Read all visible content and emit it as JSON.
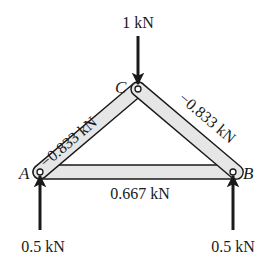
{
  "diagram": {
    "type": "truss",
    "nodes": [
      {
        "id": "A",
        "label": "A",
        "x": 40,
        "y": 172
      },
      {
        "id": "B",
        "label": "B",
        "x": 233,
        "y": 172
      },
      {
        "id": "C",
        "label": "C",
        "x": 138,
        "y": 89
      }
    ],
    "members": [
      {
        "from": "A",
        "to": "C",
        "force": "−0.833 kN"
      },
      {
        "from": "C",
        "to": "B",
        "force": "−0.833 kN"
      },
      {
        "from": "A",
        "to": "B",
        "force": "0.667 kN"
      }
    ],
    "loads": [
      {
        "at": "C",
        "direction": "down",
        "label": "1 kN"
      }
    ],
    "reactions": [
      {
        "at": "A",
        "direction": "up",
        "label": "0.5 kN"
      },
      {
        "at": "B",
        "direction": "up",
        "label": "0.5 kN"
      }
    ],
    "colors": {
      "member_fill": "#e6e6e6",
      "stroke": "#1a1a1a",
      "background": "#ffffff"
    }
  }
}
